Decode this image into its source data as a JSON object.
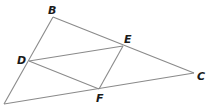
{
  "diagram": {
    "type": "triangle-with-inscribed-parallelogram",
    "points": {
      "A": {
        "x": 4,
        "y": 104,
        "label": ""
      },
      "B": {
        "x": 53,
        "y": 17,
        "label": "B"
      },
      "C": {
        "x": 194,
        "y": 73,
        "label": "C"
      },
      "D": {
        "x": 29,
        "y": 61,
        "label": "D"
      },
      "E": {
        "x": 123,
        "y": 46,
        "label": "E"
      },
      "F": {
        "x": 99,
        "y": 89,
        "label": "F"
      }
    },
    "segments": [
      [
        "A",
        "B"
      ],
      [
        "B",
        "C"
      ],
      [
        "C",
        "A"
      ],
      [
        "D",
        "E"
      ],
      [
        "E",
        "F"
      ],
      [
        "F",
        "D"
      ]
    ],
    "labels": {
      "B": {
        "text": "B",
        "x": 48,
        "y": 14
      },
      "C": {
        "text": "C",
        "x": 197,
        "y": 80
      },
      "D": {
        "text": "D",
        "x": 17,
        "y": 64
      },
      "E": {
        "text": "E",
        "x": 124,
        "y": 43
      },
      "F": {
        "text": "F",
        "x": 96,
        "y": 102
      }
    },
    "line_color": "#8a8a8a",
    "label_color": "#1a1a1a"
  }
}
